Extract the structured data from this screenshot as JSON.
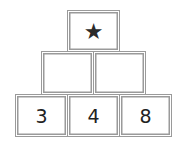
{
  "pyramid": {
    "top": {
      "symbol": "★",
      "icon": "star-icon"
    },
    "middle": [
      "",
      ""
    ],
    "bottom": [
      "3",
      "4",
      "8"
    ]
  },
  "colors": {
    "border": "#9a9a9a",
    "text": "#222222"
  }
}
